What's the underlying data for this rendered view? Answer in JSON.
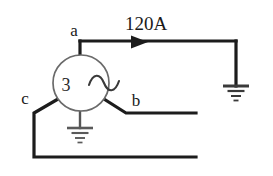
{
  "diagram": {
    "background_color": "#ffffff",
    "wire_color": "#1c1c1c",
    "symbol_color": "#4a4a4a",
    "label_color": "#1a1a1a"
  },
  "labels": {
    "terminal_a": "a",
    "terminal_b": "b",
    "terminal_c": "c",
    "current": "120A",
    "phase_count": "3",
    "ac_source": "~"
  },
  "source": {
    "name": "three-phase-ac-generator",
    "center_x": 81,
    "center_y": 83,
    "radius": 28
  },
  "grounds": [
    {
      "name": "generator-neutral-ground",
      "x": 80,
      "y": 128,
      "bars": [
        26,
        17,
        10,
        5
      ]
    },
    {
      "name": "line-a-load-ground",
      "x": 236,
      "y": 86,
      "bars": [
        26,
        17,
        10,
        5
      ]
    }
  ],
  "arrows": [
    {
      "name": "current-direction-arrow",
      "x": 142,
      "y": 42,
      "direction": "right"
    }
  ]
}
